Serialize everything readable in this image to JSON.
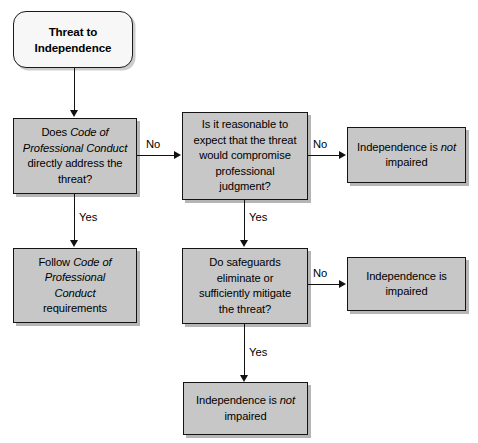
{
  "diagram": {
    "colors": {
      "node_fill": "#c7c7c7",
      "start_fill": "#f7f7f7",
      "border": "#141414",
      "text": "#000000",
      "background": "#ffffff"
    }
  },
  "nodes": {
    "start": {
      "label": "Threat to Independence",
      "line1": "Threat to",
      "line2": "Independence",
      "shape": "rounded-terminator"
    },
    "decision_code": {
      "label": "Does Code of Professional Conduct directly address the threat?",
      "line1": "Does ",
      "line1_italic": "Code of",
      "line2_italic": "Professional Conduct",
      "line3": "directly address the",
      "line4": "threat?",
      "shape": "process"
    },
    "decision_reasonable": {
      "label": "Is it reasonable to expect that the threat would compromise professional judgment?",
      "line1": "Is it reasonable to",
      "line2": "expect that the threat",
      "line3": "would compromise",
      "line4": "professional",
      "line5": "judgment?",
      "shape": "process"
    },
    "not_impaired_top": {
      "label": "Independence is not impaired",
      "line1_pre": "Independence is ",
      "line1_italic": "not",
      "line2": "impaired",
      "shape": "process"
    },
    "follow_code": {
      "label": "Follow Code of Professional Conduct requirements",
      "line1_pre": "Follow ",
      "line1_italic": "Code of",
      "line2_italic": "Professional",
      "line3_italic": "Conduct",
      "line4": "requirements",
      "shape": "process"
    },
    "decision_safeguards": {
      "label": "Do safeguards eliminate or sufficiently mitigate the threat?",
      "line1": "Do safeguards",
      "line2": "eliminate or",
      "line3": "sufficiently mitigate",
      "line4": "the threat?",
      "shape": "process"
    },
    "impaired": {
      "label": "Independence is impaired",
      "line1": "Independence is",
      "line2": "impaired",
      "shape": "process"
    },
    "not_impaired_bottom": {
      "label": "Independence is not impaired",
      "line1_pre": "Independence is ",
      "line1_italic": "not",
      "line2": "impaired",
      "shape": "process"
    }
  },
  "edges": {
    "code_no": "No",
    "code_yes": "Yes",
    "reasonable_no": "No",
    "reasonable_yes": "Yes",
    "safeguards_no": "No",
    "safeguards_yes": "Yes"
  }
}
